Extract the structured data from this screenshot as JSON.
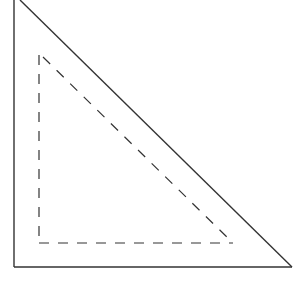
{
  "diagram": {
    "type": "nested-triangles",
    "stroke_color": "#333333",
    "background": "#ffffff",
    "outer_triangle": {
      "style": "solid",
      "points": [
        [
          14,
          0
        ],
        [
          14,
          267
        ],
        [
          292,
          267
        ]
      ],
      "diagonal_start": [
        20,
        0
      ]
    },
    "inner_triangle": {
      "style": "dashed",
      "points": [
        [
          39,
          55
        ],
        [
          39,
          243
        ],
        [
          233,
          243
        ]
      ]
    }
  }
}
